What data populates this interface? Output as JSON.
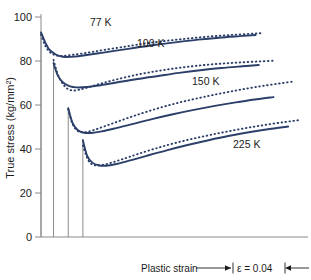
{
  "chart_data": {
    "type": "line",
    "title": "",
    "xlabel": "Plastic strain",
    "ylabel": "True stress (kg/mm²)",
    "x_scale_annotation": "ε = 0.04",
    "ylim": [
      0,
      100
    ],
    "y_ticks": [
      0,
      20,
      40,
      60,
      80,
      100
    ],
    "y_tick_labels": [
      "0",
      "20",
      "40",
      "60",
      "80",
      "100"
    ],
    "x_ticks_shown": false,
    "grid": false,
    "legend_position": "inline-annotations",
    "colors": {
      "curve": "#2b3f69",
      "axis": "#8a8a8a",
      "text": "#1b1b1b",
      "background": "#ffffff"
    },
    "note": "Each temperature shows a solid curve and a dotted companion curve; short vertical grey lines at the left mark elastic loading segments.",
    "series": [
      {
        "name": "77 K",
        "label": "77 K",
        "style": "solid",
        "offset_origin_x": 0.0,
        "points": [
          [
            0.0,
            93.0
          ],
          [
            0.004,
            88.5
          ],
          [
            0.008,
            85.2
          ],
          [
            0.013,
            83.3
          ],
          [
            0.018,
            82.2
          ],
          [
            0.024,
            81.8
          ],
          [
            0.032,
            82.0
          ],
          [
            0.042,
            82.6
          ],
          [
            0.055,
            83.5
          ],
          [
            0.07,
            84.6
          ],
          [
            0.09,
            86.0
          ],
          [
            0.11,
            87.4
          ],
          [
            0.13,
            88.6
          ],
          [
            0.15,
            89.7
          ],
          [
            0.17,
            90.6
          ],
          [
            0.19,
            91.3
          ],
          [
            0.205,
            91.8
          ]
        ]
      },
      {
        "name": "77 K dotted",
        "label": "",
        "style": "dotted",
        "offset_origin_x": 0.0,
        "points": [
          [
            0.0,
            92.0
          ],
          [
            0.004,
            87.0
          ],
          [
            0.009,
            83.8
          ],
          [
            0.015,
            82.5
          ],
          [
            0.022,
            82.4
          ],
          [
            0.032,
            82.9
          ],
          [
            0.045,
            83.8
          ],
          [
            0.06,
            85.0
          ],
          [
            0.08,
            86.5
          ],
          [
            0.1,
            88.0
          ],
          [
            0.12,
            89.2
          ],
          [
            0.14,
            90.2
          ],
          [
            0.16,
            91.1
          ],
          [
            0.18,
            91.8
          ],
          [
            0.2,
            92.4
          ],
          [
            0.212,
            92.7
          ]
        ]
      },
      {
        "name": "100 K",
        "label": "100 K",
        "style": "solid",
        "offset_origin_x": 0.012,
        "points": [
          [
            0.0,
            79.0
          ],
          [
            0.004,
            73.5
          ],
          [
            0.009,
            70.2
          ],
          [
            0.015,
            68.6
          ],
          [
            0.022,
            68.0
          ],
          [
            0.032,
            68.2
          ],
          [
            0.045,
            69.0
          ],
          [
            0.06,
            70.2
          ],
          [
            0.08,
            71.8
          ],
          [
            0.1,
            73.2
          ],
          [
            0.12,
            74.6
          ],
          [
            0.14,
            75.8
          ],
          [
            0.16,
            76.8
          ],
          [
            0.18,
            77.6
          ],
          [
            0.196,
            78.2
          ]
        ]
      },
      {
        "name": "100 K dotted",
        "label": "",
        "style": "dotted",
        "offset_origin_x": 0.012,
        "points": [
          [
            0.0,
            80.5
          ],
          [
            0.004,
            74.0
          ],
          [
            0.009,
            69.5
          ],
          [
            0.014,
            67.2
          ],
          [
            0.02,
            66.6
          ],
          [
            0.03,
            67.6
          ],
          [
            0.044,
            69.6
          ],
          [
            0.06,
            71.6
          ],
          [
            0.08,
            73.8
          ],
          [
            0.1,
            75.5
          ],
          [
            0.12,
            76.9
          ],
          [
            0.14,
            78.0
          ],
          [
            0.16,
            78.8
          ],
          [
            0.18,
            79.4
          ],
          [
            0.2,
            79.9
          ],
          [
            0.21,
            80.1
          ]
        ]
      },
      {
        "name": "150 K",
        "label": "150 K",
        "style": "solid",
        "offset_origin_x": 0.026,
        "points": [
          [
            0.0,
            58.5
          ],
          [
            0.004,
            52.0
          ],
          [
            0.009,
            48.6
          ],
          [
            0.015,
            47.4
          ],
          [
            0.022,
            47.3
          ],
          [
            0.032,
            48.0
          ],
          [
            0.045,
            49.4
          ],
          [
            0.06,
            51.2
          ],
          [
            0.08,
            53.6
          ],
          [
            0.1,
            55.8
          ],
          [
            0.12,
            57.8
          ],
          [
            0.14,
            59.6
          ],
          [
            0.16,
            61.2
          ],
          [
            0.18,
            62.6
          ],
          [
            0.196,
            63.6
          ]
        ]
      },
      {
        "name": "150 K dotted",
        "label": "",
        "style": "dotted",
        "offset_origin_x": 0.026,
        "points": [
          [
            0.0,
            58.0
          ],
          [
            0.004,
            51.5
          ],
          [
            0.009,
            48.2
          ],
          [
            0.015,
            47.6
          ],
          [
            0.023,
            48.4
          ],
          [
            0.034,
            50.2
          ],
          [
            0.048,
            52.6
          ],
          [
            0.065,
            55.4
          ],
          [
            0.085,
            58.4
          ],
          [
            0.105,
            61.0
          ],
          [
            0.125,
            63.2
          ],
          [
            0.145,
            65.2
          ],
          [
            0.165,
            67.0
          ],
          [
            0.185,
            68.6
          ],
          [
            0.205,
            70.0
          ],
          [
            0.214,
            70.6
          ]
        ]
      },
      {
        "name": "225 K",
        "label": "225 K",
        "style": "solid",
        "offset_origin_x": 0.04,
        "points": [
          [
            0.0,
            44.0
          ],
          [
            0.004,
            37.0
          ],
          [
            0.009,
            33.8
          ],
          [
            0.015,
            32.6
          ],
          [
            0.022,
            32.4
          ],
          [
            0.032,
            33.2
          ],
          [
            0.045,
            34.8
          ],
          [
            0.06,
            36.8
          ],
          [
            0.08,
            39.4
          ],
          [
            0.1,
            41.8
          ],
          [
            0.12,
            44.0
          ],
          [
            0.14,
            46.0
          ],
          [
            0.16,
            47.7
          ],
          [
            0.18,
            49.2
          ],
          [
            0.196,
            50.2
          ]
        ]
      },
      {
        "name": "225 K dotted",
        "label": "",
        "style": "dotted",
        "offset_origin_x": 0.04,
        "points": [
          [
            0.0,
            41.5
          ],
          [
            0.005,
            35.0
          ],
          [
            0.01,
            32.8
          ],
          [
            0.017,
            32.6
          ],
          [
            0.026,
            33.6
          ],
          [
            0.038,
            35.4
          ],
          [
            0.053,
            37.8
          ],
          [
            0.072,
            40.6
          ],
          [
            0.092,
            43.2
          ],
          [
            0.112,
            45.4
          ],
          [
            0.132,
            47.4
          ],
          [
            0.152,
            49.2
          ],
          [
            0.172,
            50.8
          ],
          [
            0.192,
            52.2
          ],
          [
            0.208,
            53.2
          ]
        ]
      }
    ],
    "elastic_lines": [
      {
        "name": "elastic-77K",
        "x": 0.0,
        "y_top": 93.0
      },
      {
        "name": "elastic-100K",
        "x": 0.012,
        "y_top": 81.0
      },
      {
        "name": "elastic-150K",
        "x": 0.026,
        "y_top": 59.0
      },
      {
        "name": "elastic-225K",
        "x": 0.04,
        "y_top": 44.5
      }
    ],
    "annotations": [
      {
        "name": "label-77K",
        "text": "77 K",
        "x_px": 90,
        "y_px": 26
      },
      {
        "name": "label-100K",
        "text": "100 K",
        "x_px": 137,
        "y_px": 47
      },
      {
        "name": "label-150K",
        "text": "150 K",
        "x_px": 192,
        "y_px": 85
      },
      {
        "name": "label-225K",
        "text": "225 K",
        "x_px": 233,
        "y_px": 148
      }
    ]
  }
}
